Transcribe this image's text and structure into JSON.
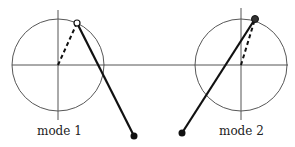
{
  "diagram": {
    "type": "pendulum-mode-shapes",
    "horizontal_axis": {
      "x1": 12,
      "x2": 288,
      "y": 65,
      "color": "#555555"
    },
    "panels": [
      {
        "label": "mode 1",
        "label_pos": {
          "x": 37,
          "y": 124
        },
        "circle": {
          "cx": 58,
          "cy": 65,
          "r": 46
        },
        "vertical_axis": {
          "x": 58,
          "y1": 10,
          "y2": 120
        },
        "crank_dashed": {
          "x1": 58,
          "y1": 65,
          "x2": 77,
          "y2": 23
        },
        "rod": {
          "x1": 77,
          "y1": 23,
          "x2": 134,
          "y2": 136
        },
        "pivot": {
          "x": 77,
          "y": 23,
          "style": "open"
        },
        "bob": {
          "x": 134,
          "y": 136
        }
      },
      {
        "label": "mode 2",
        "label_pos": {
          "x": 219,
          "y": 124
        },
        "circle": {
          "cx": 241,
          "cy": 65,
          "r": 46
        },
        "vertical_axis": {
          "x": 241,
          "y1": 8,
          "y2": 120
        },
        "crank_dashed": {
          "x1": 241,
          "y1": 65,
          "x2": 255,
          "y2": 19
        },
        "rod": {
          "x1": 255,
          "y1": 19,
          "x2": 182,
          "y2": 133
        },
        "pivot": {
          "x": 255,
          "y": 19,
          "style": "filled"
        },
        "bob": {
          "x": 182,
          "y": 133
        }
      }
    ],
    "colors": {
      "line": "#555555",
      "rod": "#111111",
      "circle": "#444444"
    }
  }
}
